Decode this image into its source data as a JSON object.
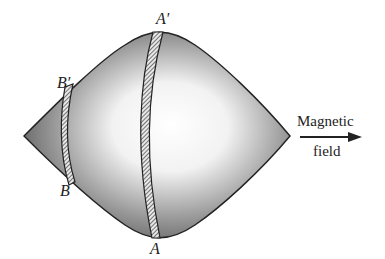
{
  "diagram": {
    "labels": {
      "a_prime": "A′",
      "a": "A",
      "b_prime": "B′",
      "b": "B"
    },
    "field_label": {
      "line1": "Magnetic",
      "line2": "field"
    },
    "colors": {
      "body_dark": "#5a5a5a",
      "body_light": "#ffffff",
      "outline": "#222222",
      "arrow": "#222222"
    }
  }
}
